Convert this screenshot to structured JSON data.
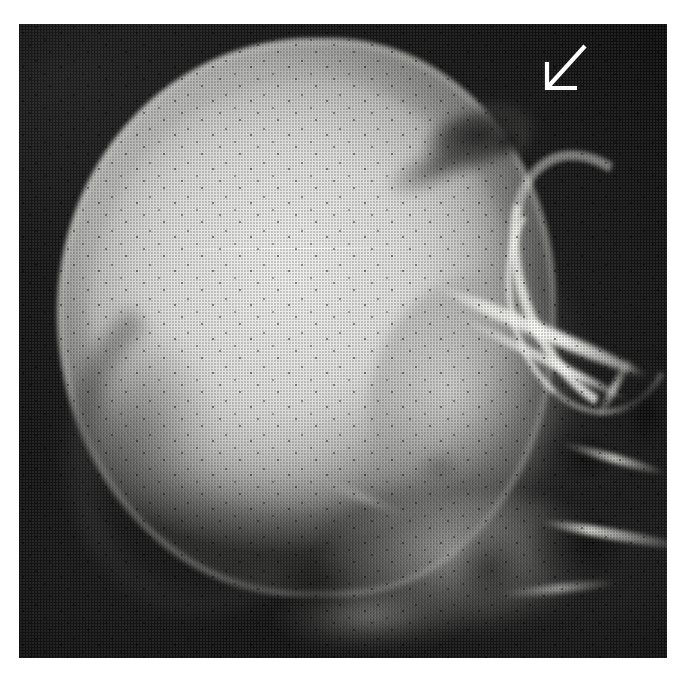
{
  "figure": {
    "kind": "radiograph",
    "modality": "plain-film-x-ray",
    "body_part": "skull",
    "projection": "lateral",
    "caption": "",
    "background_color": "#ffffff",
    "film_base_color": "#0b0b0b",
    "bone_color": "#e6e6e4",
    "annotation_color": "#ffffff"
  },
  "plate": {
    "left": 19,
    "top": 24,
    "width": 648,
    "height": 634
  },
  "annotations": [
    {
      "id": "arrow-1",
      "type": "arrow",
      "color": "#ffffff",
      "label": "",
      "tail_x": 585,
      "tail_y": 46,
      "tip_x": 547,
      "tip_y": 88,
      "points_to": "fronto-parietal lucent lesion"
    }
  ],
  "regions": [
    {
      "name": "cranial-vault",
      "appearance": "radiopaque"
    },
    {
      "name": "lucent-lesion-fronto-parietal",
      "appearance": "radiolucent"
    },
    {
      "name": "orbital-rim",
      "appearance": "radiopaque"
    },
    {
      "name": "sphenoid-ridge",
      "appearance": "radiopaque"
    },
    {
      "name": "petrous-mastoid-air-cells",
      "appearance": "radiolucent"
    },
    {
      "name": "facial-skeleton",
      "appearance": "mixed"
    },
    {
      "name": "occipital-inner-table",
      "appearance": "mixed"
    },
    {
      "name": "emulsion-scratch",
      "appearance": "artifact"
    }
  ]
}
